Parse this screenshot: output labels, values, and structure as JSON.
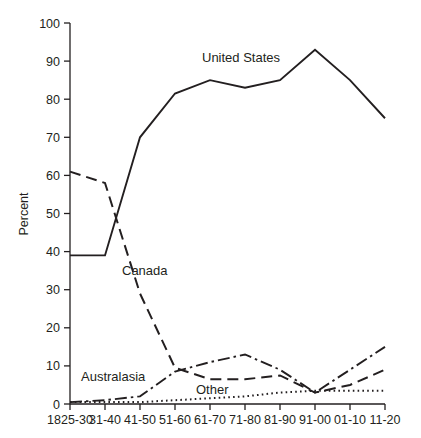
{
  "chart_data": {
    "type": "line",
    "title": "",
    "xlabel": "",
    "ylabel": "Percent",
    "ylim": [
      0,
      100
    ],
    "yticks": [
      0,
      10,
      20,
      30,
      40,
      50,
      60,
      70,
      80,
      90,
      100
    ],
    "grid": false,
    "legend": "inline-annotations",
    "categories": [
      "1825-30",
      "31-40",
      "41-50",
      "51-60",
      "61-70",
      "71-80",
      "81-90",
      "91-00",
      "01-10",
      "11-20"
    ],
    "series": [
      {
        "name": "United States",
        "style": "solid",
        "label_x_index": 4.1,
        "values": [
          39,
          39,
          70,
          81.5,
          85,
          83,
          85,
          93,
          85,
          75
        ]
      },
      {
        "name": "Canada",
        "style": "dashed",
        "label_x_index": 1.85,
        "values": [
          61,
          58,
          29,
          9.5,
          6.5,
          6.5,
          7.5,
          3,
          5,
          9
        ]
      },
      {
        "name": "Australasia",
        "style": "dash-dot",
        "label_x_index": 0.6,
        "values": [
          0.5,
          1,
          2,
          8.5,
          11,
          13,
          9,
          3,
          9,
          15
        ]
      },
      {
        "name": "Other",
        "style": "dotted",
        "label_x_index": 3.25,
        "values": [
          0.5,
          0.5,
          0.5,
          1,
          1.5,
          2,
          3,
          3.5,
          3.5,
          3.5
        ]
      }
    ]
  },
  "axes": {
    "y_title": "Percent",
    "y_tick_labels": [
      "100",
      "90",
      "80",
      "70",
      "60",
      "50",
      "40",
      "30",
      "20",
      "10",
      "0"
    ],
    "x_tick_labels": [
      "1825-30",
      "31-40",
      "41-50",
      "51-60",
      "61-70",
      "71-80",
      "81-90",
      "91-00",
      "01-10",
      "11-20"
    ]
  },
  "annotations": {
    "united_states": "United States",
    "canada": "Canada",
    "australasia": "Australasia",
    "other": "Other"
  },
  "colors": {
    "ink": "#231f20",
    "background": "#ffffff"
  }
}
